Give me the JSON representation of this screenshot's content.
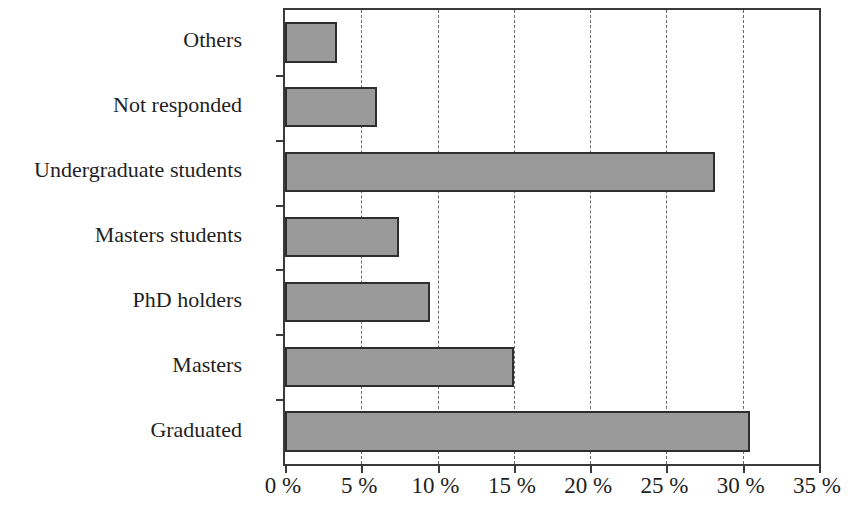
{
  "chart_data": {
    "type": "bar",
    "orientation": "horizontal",
    "title": "",
    "subtitle": "",
    "xlabel": "",
    "ylabel": "",
    "categories": [
      "Graduated",
      "Masters",
      "PhD holders",
      "Masters students",
      "Undergraduate students",
      "Not responded",
      "Others"
    ],
    "values": [
      30.5,
      15.0,
      9.5,
      7.5,
      28.2,
      6.0,
      3.4
    ],
    "value_unit": "%",
    "xlim": [
      0,
      35
    ],
    "xticks": [
      0,
      5,
      10,
      15,
      20,
      25,
      30,
      35
    ],
    "xtick_labels": [
      "0 %",
      "5 %",
      "10 %",
      "15 %",
      "20 %",
      "25 %",
      "30 %",
      "35 %"
    ],
    "grid": "vertical-dashed",
    "legend": "none",
    "bar_fill_color": "#9a9a9a",
    "bar_border_color": "#2e2e2e",
    "axis_color": "#3a3a3a",
    "gridline_color": "#6a6a6a",
    "background_color": "#ffffff"
  }
}
